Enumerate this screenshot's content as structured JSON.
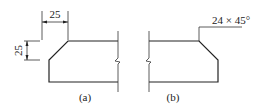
{
  "figure": {
    "panel_a": {
      "caption": "(a)",
      "dim_horizontal": "25",
      "dim_vertical": "25"
    },
    "panel_b": {
      "caption": "(b)",
      "chamfer_label": "24 × 45°"
    }
  },
  "colors": {
    "line": "#222222",
    "background": "#ffffff"
  }
}
